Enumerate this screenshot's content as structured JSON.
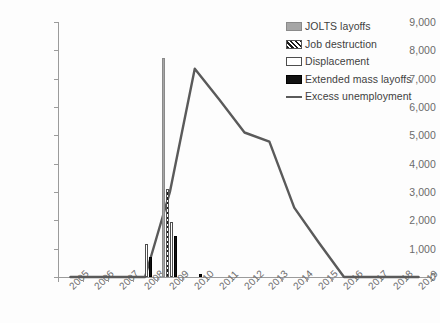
{
  "chart_data": {
    "type": "bar",
    "title": "",
    "subtitle": "",
    "xlabel": "",
    "ylabel": "",
    "ylim": [
      0,
      9000
    ],
    "ytick_step": 1000,
    "grid": false,
    "legend_position": "top-right",
    "categories": [
      "2005",
      "2006",
      "2007",
      "2008",
      "2009",
      "2010",
      "2011",
      "2012",
      "2013",
      "2014",
      "2015",
      "2016",
      "2017",
      "2018",
      "2019"
    ],
    "ytick_labels": [
      "9,000",
      "8,000",
      "7,000",
      "6,000",
      "5,000",
      "4,000",
      "3,000",
      "2,000",
      "1,000",
      "0"
    ],
    "ytick_values": [
      9000,
      8000,
      7000,
      6000,
      5000,
      4000,
      3000,
      2000,
      1000,
      0
    ],
    "series": [
      {
        "name": "JOLTS layoffs",
        "kind": "bar",
        "style": "gray-fill",
        "color": "#a6a6a6",
        "values": [
          0,
          0,
          0,
          0,
          7720,
          0,
          0,
          0,
          0,
          0,
          0,
          0,
          0,
          0,
          0
        ]
      },
      {
        "name": "Job destruction",
        "kind": "bar",
        "style": "diagonal-hatch",
        "color": "#1a1a1a",
        "values": [
          0,
          0,
          0,
          0,
          3100,
          0,
          0,
          0,
          0,
          0,
          0,
          0,
          0,
          0,
          0
        ]
      },
      {
        "name": "Displacement",
        "kind": "bar",
        "style": "white-outline",
        "color": "#ffffff",
        "values": [
          0,
          0,
          0,
          1150,
          1950,
          0,
          0,
          0,
          0,
          0,
          0,
          0,
          0,
          0,
          0
        ]
      },
      {
        "name": "Extended mass layoffs",
        "kind": "bar",
        "style": "black-fill",
        "color": "#111111",
        "values": [
          0,
          0,
          0,
          700,
          1450,
          100,
          0,
          0,
          0,
          0,
          0,
          0,
          0,
          0,
          0
        ]
      },
      {
        "name": "Excess unemployment",
        "kind": "line",
        "style": "solid-line",
        "color": "#5a5a5a",
        "values": [
          0,
          0,
          0,
          0,
          3000,
          7350,
          6250,
          5100,
          4780,
          2450,
          1200,
          0,
          0,
          0,
          0
        ]
      }
    ]
  },
  "legend": {
    "items": [
      {
        "label": "JOLTS layoffs",
        "swatch": "gray-fill-swatch"
      },
      {
        "label": "Job destruction",
        "swatch": "hatch-swatch"
      },
      {
        "label": "Displacement",
        "swatch": "white-outline-swatch"
      },
      {
        "label": "Extended mass layoffs",
        "swatch": "black-fill-swatch"
      },
      {
        "label": "Excess unemployment",
        "swatch": "line-swatch"
      }
    ]
  }
}
